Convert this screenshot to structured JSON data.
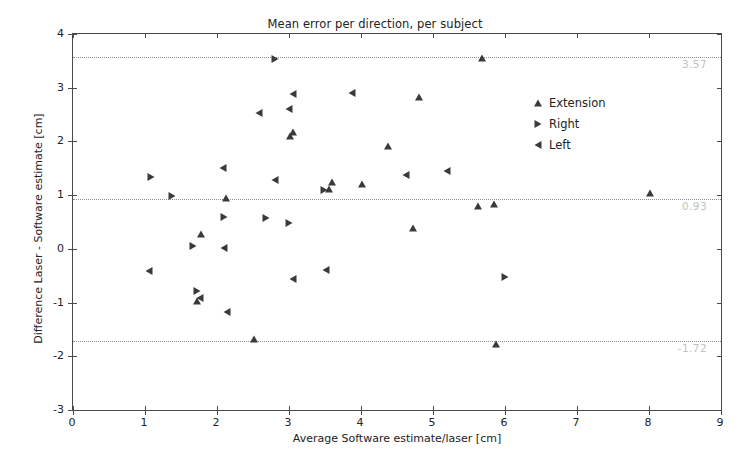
{
  "chart_data": {
    "type": "scatter",
    "title": "Mean error per direction, per subject",
    "xlabel": "Average Software estimate/laser [cm]",
    "ylabel": "Difference Laser - Software estimate [cm]",
    "xlim": [
      0,
      9
    ],
    "ylim": [
      -3,
      4
    ],
    "xticks": [
      0,
      1,
      2,
      3,
      4,
      5,
      6,
      7,
      8,
      9
    ],
    "xtick_labels": [
      "0",
      "1",
      "2",
      "3",
      "4",
      "5",
      "6",
      "7",
      "8",
      "9"
    ],
    "yticks": [
      -3,
      -2,
      -1,
      0,
      1,
      2,
      3,
      4
    ],
    "ytick_labels": [
      "-3",
      "-2",
      "-1",
      "0",
      "1",
      "2",
      "3",
      "4"
    ],
    "grid": false,
    "legend_position": "upper right",
    "marker_color": "#3a3a3a",
    "reference_lines": [
      {
        "name": "upper-limit-of-agreement",
        "y": 3.57,
        "label": "3.57",
        "style": "dotted",
        "color": "#8e8e8e"
      },
      {
        "name": "mean-bias",
        "y": 0.93,
        "label": "0.93",
        "style": "dotted",
        "color": "#8e8e8e"
      },
      {
        "name": "lower-limit-of-agreement",
        "y": -1.72,
        "label": "-1.72",
        "style": "dotted",
        "color": "#8e8e8e"
      }
    ],
    "series": [
      {
        "name": "Extension",
        "marker": "triangle-up",
        "points": [
          [
            1.72,
            -0.98
          ],
          [
            1.78,
            0.27
          ],
          [
            2.12,
            0.94
          ],
          [
            2.52,
            -1.68
          ],
          [
            3.02,
            2.11
          ],
          [
            3.05,
            2.18
          ],
          [
            3.55,
            1.11
          ],
          [
            3.6,
            1.24
          ],
          [
            4.02,
            1.21
          ],
          [
            4.38,
            1.92
          ],
          [
            4.72,
            0.38
          ],
          [
            4.8,
            2.82
          ],
          [
            5.62,
            0.79
          ],
          [
            5.68,
            3.55
          ],
          [
            5.85,
            0.84
          ],
          [
            5.88,
            -1.78
          ],
          [
            8.02,
            1.04
          ]
        ]
      },
      {
        "name": "Right",
        "marker": "triangle-right",
        "points": [
          [
            1.08,
            1.34
          ],
          [
            1.38,
            0.99
          ],
          [
            1.66,
            0.05
          ],
          [
            1.72,
            -0.79
          ],
          [
            2.1,
            0.6
          ],
          [
            2.68,
            0.57
          ],
          [
            2.8,
            3.53
          ],
          [
            3.0,
            0.49
          ],
          [
            3.48,
            1.09
          ],
          [
            6.0,
            -0.53
          ]
        ]
      },
      {
        "name": "Left",
        "marker": "triangle-left",
        "points": [
          [
            1.05,
            -0.41
          ],
          [
            1.76,
            -0.92
          ],
          [
            2.08,
            1.51
          ],
          [
            2.1,
            0.01
          ],
          [
            2.14,
            -1.17
          ],
          [
            2.58,
            2.52
          ],
          [
            2.8,
            1.28
          ],
          [
            3.0,
            2.61
          ],
          [
            3.05,
            2.88
          ],
          [
            3.05,
            -0.57
          ],
          [
            3.52,
            -0.4
          ],
          [
            3.88,
            2.9
          ],
          [
            4.62,
            1.38
          ],
          [
            5.2,
            1.45
          ]
        ]
      }
    ]
  },
  "legend": {
    "items": [
      {
        "label": "Extension",
        "marker": "triangle-up"
      },
      {
        "label": "Right",
        "marker": "triangle-right"
      },
      {
        "label": "Left",
        "marker": "triangle-left"
      }
    ]
  }
}
